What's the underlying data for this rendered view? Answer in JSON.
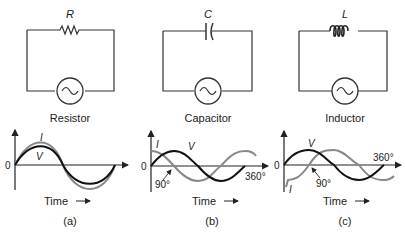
{
  "panels": [
    {
      "component_symbol": "R",
      "name": "Resistor",
      "caption": "(a)",
      "current_label": "I",
      "voltage_label": "V",
      "zero_label": "0",
      "time_label": "Time"
    },
    {
      "component_symbol": "C",
      "name": "Capacitor",
      "caption": "(b)",
      "current_label": "I",
      "voltage_label": "V",
      "zero_label": "0",
      "phase_label": "90°",
      "cycle_label": "360°",
      "time_label": "Time"
    },
    {
      "component_symbol": "L",
      "name": "Inductor",
      "caption": "(c)",
      "current_label": "I",
      "voltage_label": "V",
      "zero_label": "0",
      "phase_label": "90°",
      "cycle_label": "360°",
      "time_label": "Time"
    }
  ],
  "colors": {
    "voltage": "#111111",
    "current": "#888888",
    "wire": "#333333"
  }
}
